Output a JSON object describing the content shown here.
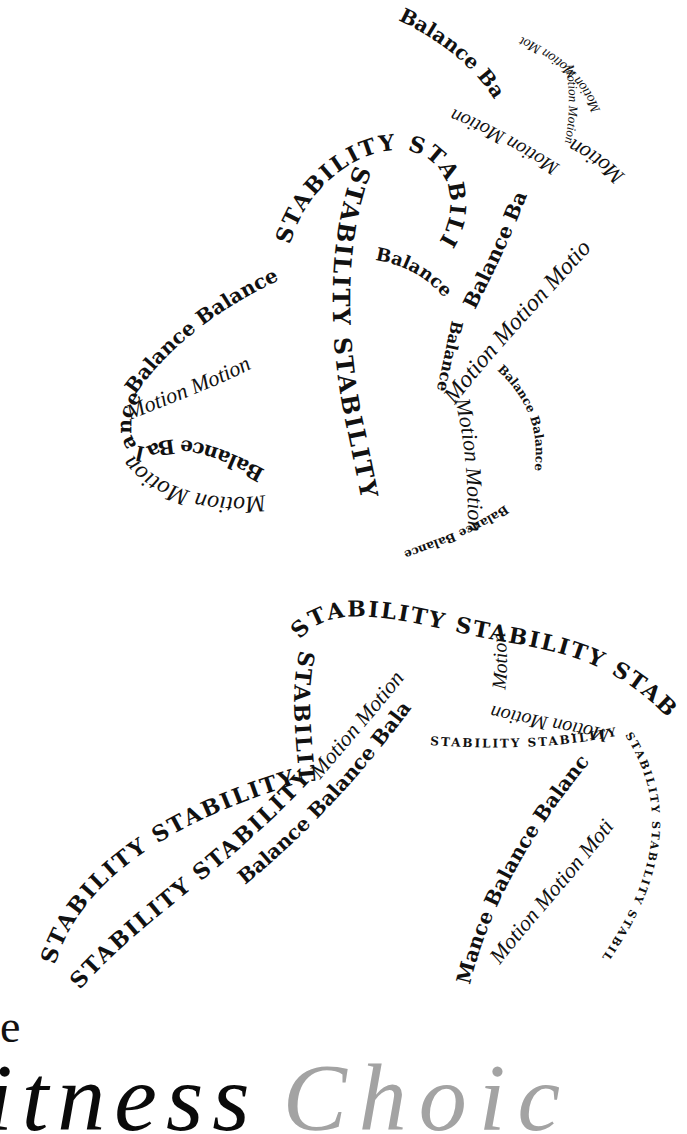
{
  "figure": {
    "words": {
      "stability": "STABILITY STABILITY",
      "stability_long": "STABILITY STABILITY STABILITY",
      "balance": "Balance Balance",
      "balance_single": "Balance",
      "motion": "Motion Motion",
      "motion_single": "Motion",
      "balance_ba": "Balance Ba",
      "motion_mot": "Motion Motion Mot",
      "motion_motio": "Motion Motion Motio",
      "balance_bala": "Balance Balance Bala",
      "stability_small": "STABILITY STABILITY",
      "mance": "Mance Balance Balanc",
      "motion_moti": "Motion Motion Moti",
      "balance_bal": "Balance Bal",
      "motion_moti2": "Motion Moti"
    },
    "colors": {
      "ink": "#111111",
      "background": "#ffffff"
    }
  },
  "title": {
    "line1": "e",
    "word1": "itness",
    "word2": "Choic",
    "colors": {
      "word1": "#0a0a0a",
      "word2": "#a3a3a3"
    }
  }
}
